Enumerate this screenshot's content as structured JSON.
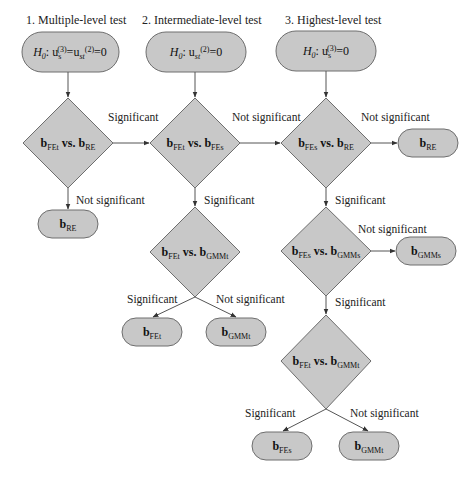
{
  "columns": [
    {
      "title": "1. Multiple-level test",
      "hypothesis": {
        "H": "H",
        "H_sub": "0",
        "sep": ":",
        "u1": "u",
        "u1_sub": "s",
        "u1_sup": "(3)",
        "eq1": "=",
        "u2": "u",
        "u2_sub": "st",
        "u2_sup": "(2)",
        "eq2": "=0"
      }
    },
    {
      "title": "2. Intermediate-level test",
      "hypothesis": {
        "H": "H",
        "H_sub": "0",
        "sep": ":",
        "u1": "u",
        "u1_sub": "st",
        "u1_sup": "(2)",
        "eq1": "=0"
      }
    },
    {
      "title": "3. Highest-level test",
      "hypothesis": {
        "H": "H",
        "H_sub": "0",
        "sep": ":",
        "u1": "u",
        "u1_sub": "s",
        "u1_sup": "(3)",
        "eq1": "=0"
      }
    }
  ],
  "decisions": [
    {
      "id": "d1",
      "left": "b",
      "left_sub": "FEt",
      "vs": " vs. ",
      "right": "b",
      "right_sub": "RE"
    },
    {
      "id": "d2",
      "left": "b",
      "left_sub": "FEt",
      "vs": " vs. ",
      "right": "b",
      "right_sub": "FEs"
    },
    {
      "id": "d3",
      "left": "b",
      "left_sub": "FEs",
      "vs": " vs. ",
      "right": "b",
      "right_sub": "RE"
    },
    {
      "id": "d4",
      "left": "b",
      "left_sub": "FEt",
      "vs": " vs. ",
      "right": "b",
      "right_sub": "GMMt"
    },
    {
      "id": "d5",
      "left": "b",
      "left_sub": "FEs",
      "vs": " vs. ",
      "right": "b",
      "right_sub": "GMMs"
    },
    {
      "id": "d6",
      "left": "b",
      "left_sub": "FEt",
      "vs": " vs. ",
      "right": "b",
      "right_sub": "GMMt"
    }
  ],
  "outcomes": [
    {
      "id": "o1",
      "main": "b",
      "sub": "RE"
    },
    {
      "id": "o2",
      "main": "b",
      "sub": "RE"
    },
    {
      "id": "o3",
      "main": "b",
      "sub": "GMMs"
    },
    {
      "id": "o4",
      "main": "b",
      "sub": "FEt"
    },
    {
      "id": "o5",
      "main": "b",
      "sub": "GMMt"
    },
    {
      "id": "o6",
      "main": "b",
      "sub": "FEs"
    },
    {
      "id": "o7",
      "main": "b",
      "sub": "GMMt"
    }
  ],
  "edge_labels": {
    "d1_to_d2": "Significant",
    "d1_to_o1": "Not significant",
    "d2_to_d3": "Not significant",
    "d2_to_d4": "Significant",
    "d3_to_o2": "Not significant",
    "d3_to_d5": "Significant",
    "d4_to_o4": "Significant",
    "d4_to_o5": "Not significant",
    "d5_to_o3": "Not significant",
    "d5_to_d6": "Significant",
    "d6_to_o6": "Significant",
    "d6_to_o7": "Not significant"
  },
  "colors": {
    "shape_fill": "#c8c8c8",
    "shape_stroke": "#6e6e6e",
    "edge": "#555555"
  }
}
